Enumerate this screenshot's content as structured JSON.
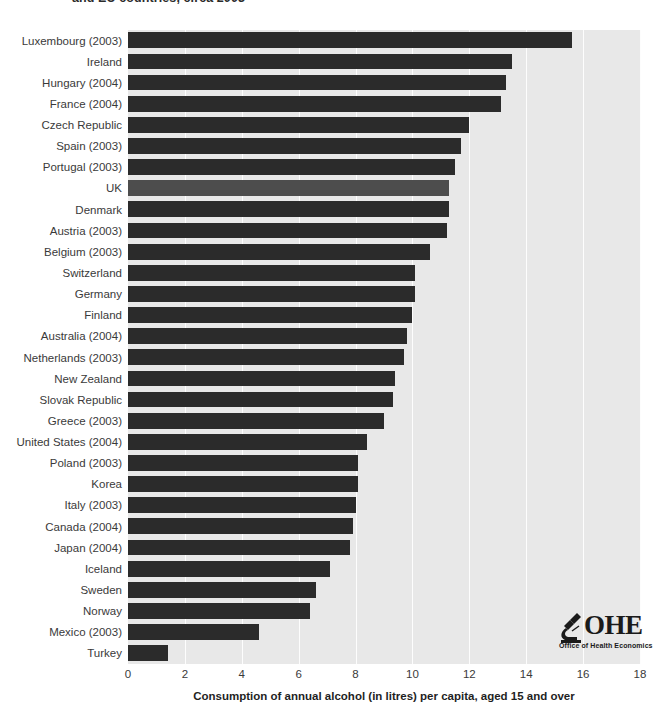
{
  "title": {
    "text": "and EU countries, circa 2003"
  },
  "logo": {
    "wordmark": "OHE",
    "subtitle": "Office of Health Economics",
    "icon": "microscope-icon"
  },
  "axis": {
    "x_title": "Consumption of annual alcohol (in litres) per capita,  aged 15 and over",
    "x_ticks": [
      "0",
      "2",
      "4",
      "6",
      "8",
      "10",
      "12",
      "14",
      "16",
      "18"
    ]
  },
  "chart_data": {
    "type": "bar",
    "orientation": "horizontal",
    "title": "and EU countries, circa 2003",
    "xlabel": "Consumption of annual alcohol (in litres) per capita,  aged 15 and over",
    "ylabel": "",
    "xlim": [
      0,
      18
    ],
    "xticks": [
      0,
      2,
      4,
      6,
      8,
      10,
      12,
      14,
      16,
      18
    ],
    "grid": true,
    "legend": null,
    "bar_color": "#2b2b2b",
    "highlight_color": "#4d4d4d",
    "plot_background": "#e8e8e8",
    "highlight_category": "UK",
    "categories": [
      "Luxembourg (2003)",
      "Ireland",
      "Hungary (2004)",
      "France (2004)",
      "Czech Republic",
      "Spain (2003)",
      "Portugal (2003)",
      "UK",
      "Denmark",
      "Austria (2003)",
      "Belgium (2003)",
      "Switzerland",
      "Germany",
      "Finland",
      "Australia (2004)",
      "Netherlands (2003)",
      "New Zealand",
      "Slovak Republic",
      "Greece (2003)",
      "United States (2004)",
      "Poland (2003)",
      "Korea",
      "Italy (2003)",
      "Canada (2004)",
      "Japan (2004)",
      "Iceland",
      "Sweden",
      "Norway",
      "Mexico (2003)",
      "Turkey"
    ],
    "values": [
      15.6,
      13.5,
      13.3,
      13.1,
      12.0,
      11.7,
      11.5,
      11.3,
      11.3,
      11.2,
      10.6,
      10.1,
      10.1,
      10.0,
      9.8,
      9.7,
      9.4,
      9.3,
      9.0,
      8.4,
      8.1,
      8.1,
      8.0,
      7.9,
      7.8,
      7.1,
      6.6,
      6.4,
      4.6,
      1.4
    ]
  }
}
